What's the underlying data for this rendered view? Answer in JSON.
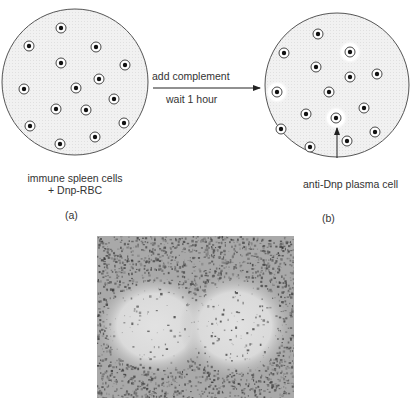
{
  "figure": {
    "panel_a": {
      "label": "(a)",
      "caption_line1": "immune spleen cells",
      "caption_line2": "+ Dnp-RBC",
      "cells": [
        [
          61,
          28
        ],
        [
          29,
          46
        ],
        [
          96,
          47
        ],
        [
          61,
          63
        ],
        [
          125,
          65
        ],
        [
          99,
          79
        ],
        [
          76,
          88
        ],
        [
          24,
          89
        ],
        [
          114,
          99
        ],
        [
          56,
          109
        ],
        [
          86,
          110
        ],
        [
          30,
          126
        ],
        [
          124,
          123
        ],
        [
          95,
          137
        ],
        [
          60,
          144
        ]
      ]
    },
    "panel_b": {
      "label": "(b)",
      "annotation": "anti-Dnp plasma cell",
      "cells": [
        [
          318,
          34
        ],
        [
          284,
          53
        ],
        [
          350,
          52
        ],
        [
          316,
          67
        ],
        [
          350,
          77
        ],
        [
          377,
          74
        ],
        [
          277,
          92
        ],
        [
          329,
          92
        ],
        [
          306,
          114
        ],
        [
          364,
          108
        ],
        [
          336,
          118
        ],
        [
          281,
          129
        ],
        [
          347,
          141
        ],
        [
          375,
          132
        ],
        [
          310,
          147
        ]
      ],
      "plaques": [
        [
          350,
          52
        ],
        [
          277,
          92
        ],
        [
          336,
          118
        ]
      ]
    },
    "arrow": {
      "label_top": "add complement",
      "label_bottom": "wait 1 hour"
    },
    "photo": {
      "description": "micrograph of hemolytic plaques"
    }
  }
}
